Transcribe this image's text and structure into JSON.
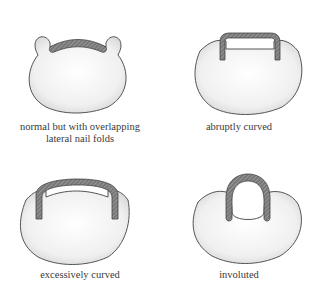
{
  "figures": [
    {
      "id": "normal-overlapping",
      "caption_line1": "normal but with overlapping",
      "caption_line2": "lateral nail folds"
    },
    {
      "id": "abruptly-curved",
      "caption_line1": "abruptly curved"
    },
    {
      "id": "excessively-curved",
      "caption_line1": "excessively curved"
    },
    {
      "id": "involuted",
      "caption_line1": "involuted"
    }
  ],
  "colors": {
    "outline": "#555555",
    "nail_fill": "#6a6a6a",
    "nail_hatch": "#9a9a9a",
    "fill": "#f4f4f4"
  }
}
